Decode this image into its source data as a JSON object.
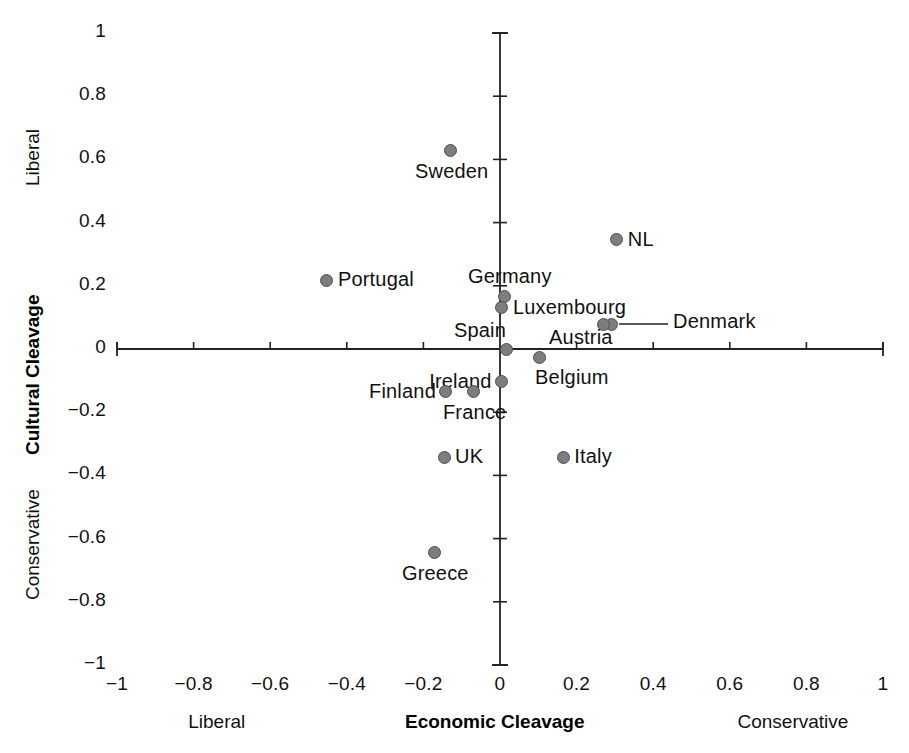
{
  "chart_data": {
    "type": "scatter",
    "title": "",
    "xlabel": "Economic Cleavage",
    "ylabel": "Cultural Cleavage",
    "xlim": [
      -1,
      1
    ],
    "ylim": [
      -1,
      1
    ],
    "grid": false,
    "legend": "none",
    "axis_end_labels": {
      "x_left": "Liberal",
      "x_right": "Conservative",
      "y_top": "Liberal",
      "y_bottom": "Conservative"
    },
    "xticks": [
      "−1",
      "−0.8",
      "−0.6",
      "−0.4",
      "−0.2",
      "0",
      "0.2",
      "0.4",
      "0.6",
      "0.8",
      "1"
    ],
    "xtick_values": [
      -1,
      -0.8,
      -0.6,
      -0.4,
      -0.2,
      0,
      0.2,
      0.4,
      0.6,
      0.8,
      1
    ],
    "yticks": [
      "1",
      "0.8",
      "0.6",
      "0.4",
      "0.2",
      "0",
      "−0.2",
      "−0.4",
      "−0.6",
      "−0.8",
      "−1"
    ],
    "ytick_values": [
      1,
      0.8,
      0.6,
      0.4,
      0.2,
      0,
      -0.2,
      -0.4,
      -0.6,
      -0.8,
      -1
    ],
    "marker_color": "#7d7d7d",
    "marker_edge_color": "#4f4f4f",
    "axis_color": "#222222",
    "points": [
      {
        "label": "Sweden",
        "x": -0.128,
        "y": 0.627,
        "label_pos": "below"
      },
      {
        "label": "NL",
        "x": 0.305,
        "y": 0.345,
        "label_pos": "right"
      },
      {
        "label": "Portugal",
        "x": -0.452,
        "y": 0.218,
        "label_pos": "right"
      },
      {
        "label": "Germany",
        "x": 0.013,
        "y": 0.165,
        "label_pos": "above"
      },
      {
        "label": "Luxembourg",
        "x": 0.005,
        "y": 0.13,
        "label_pos": "right"
      },
      {
        "label": "Denmark",
        "x": 0.29,
        "y": 0.079,
        "label_pos": "leader-right"
      },
      {
        "label": "Austria",
        "x": 0.269,
        "y": 0.079,
        "label_pos": "below-left"
      },
      {
        "label": "Spain",
        "x": 0.018,
        "y": 0.0,
        "label_pos": "above-left"
      },
      {
        "label": "Belgium",
        "x": 0.102,
        "y": -0.028,
        "label_pos": "below-right"
      },
      {
        "label": "Ireland",
        "x": 0.003,
        "y": -0.104,
        "label_pos": "left"
      },
      {
        "label": "France",
        "x": -0.068,
        "y": -0.136,
        "label_pos": "below"
      },
      {
        "label": "Finland",
        "x": -0.141,
        "y": -0.136,
        "label_pos": "left"
      },
      {
        "label": "UK",
        "x": -0.146,
        "y": -0.342,
        "label_pos": "right"
      },
      {
        "label": "Italy",
        "x": 0.165,
        "y": -0.342,
        "label_pos": "right"
      },
      {
        "label": "Greece",
        "x": -0.17,
        "y": -0.645,
        "label_pos": "below"
      }
    ]
  }
}
